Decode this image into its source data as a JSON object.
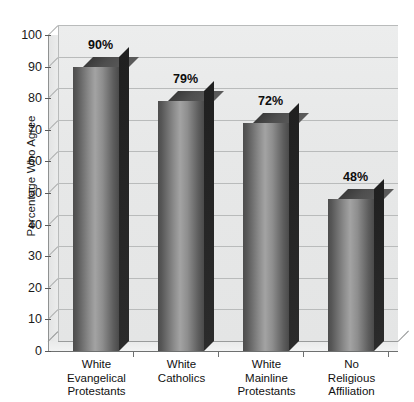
{
  "chart_data": {
    "type": "bar",
    "title": "",
    "xlabel": "",
    "ylabel": "Percentage Who Agree",
    "categories": [
      "White Evangelical Protestants",
      "White Catholics",
      "White Mainline Protestants",
      "No Religious Affiliation"
    ],
    "category_lines": [
      [
        "White",
        "Evangelical",
        "Protestants"
      ],
      [
        "White",
        "Catholics"
      ],
      [
        "White",
        "Mainline",
        "Protestants"
      ],
      [
        "No",
        "Religious",
        "Affiliation"
      ]
    ],
    "values": [
      90,
      79,
      72,
      48
    ],
    "data_labels": [
      "90%",
      "79%",
      "72%",
      "48%"
    ],
    "ylim": [
      0,
      100
    ],
    "yticks": [
      0,
      10,
      20,
      30,
      40,
      50,
      60,
      70,
      80,
      90,
      100
    ],
    "ytick_labels": [
      "0",
      "10",
      "20",
      "30",
      "40",
      "50",
      "60",
      "70",
      "80",
      "90",
      "100"
    ],
    "grid": true,
    "legend": null,
    "style": "3d-grayscale",
    "colors": {
      "bar_front_light": "#a3a3a3",
      "bar_front_dark": "#4a4a4a",
      "bar_side": "#242424",
      "bar_top": "#4e4e4e",
      "wall": "#e7e8e8",
      "gridline": "#b9bbbb",
      "axis": "#6e7070",
      "text": "#111111"
    }
  }
}
